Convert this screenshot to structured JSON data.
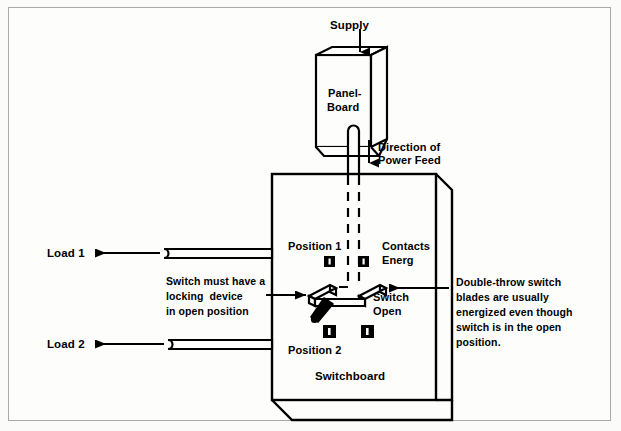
{
  "diagram": {
    "title_context": "Double-throw switch / switchboard power feed diagram",
    "labels": {
      "supply": "Supply",
      "panel_board_line1": "Panel-",
      "panel_board_line2": "Board",
      "direction_line1": "Direction of",
      "direction_line2": "Power Feed",
      "position_1": "Position 1",
      "position_2": "Position 2",
      "contacts_line1": "Contacts",
      "contacts_line2": "Energ",
      "switch_open_line1": "Switch",
      "switch_open_line2": "Open",
      "switchboard": "Switchboard",
      "load_1": "Load 1",
      "load_2": "Load 2"
    },
    "annotations": {
      "left_note": [
        "Switch must have a",
        "locking  device",
        "in open position"
      ],
      "right_note": [
        "Double-throw switch",
        "blades are usually",
        "energized even though",
        "switch is in the open",
        "position."
      ]
    },
    "colors": {
      "ink": "#000000",
      "background": "#fdfdfc",
      "frame": "#a9a9a9"
    },
    "components": [
      {
        "name": "panel-board",
        "type": "enclosure"
      },
      {
        "name": "switchboard",
        "type": "enclosure"
      },
      {
        "name": "feeder-conduit",
        "type": "conduit"
      },
      {
        "name": "load-1-conduit",
        "type": "conduit"
      },
      {
        "name": "load-2-conduit",
        "type": "conduit"
      },
      {
        "name": "double-throw-switch",
        "type": "switch"
      },
      {
        "name": "contact-terminal",
        "type": "contact",
        "count": 4
      }
    ]
  }
}
